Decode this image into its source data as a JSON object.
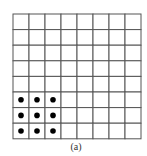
{
  "figure": {
    "caption": "(a)",
    "grid": {
      "rows": 8,
      "cols": 8,
      "line_color": "#555555",
      "dot_color": "#000000",
      "dots": [
        {
          "row": 5,
          "col": 0
        },
        {
          "row": 5,
          "col": 1
        },
        {
          "row": 5,
          "col": 2
        },
        {
          "row": 6,
          "col": 0
        },
        {
          "row": 6,
          "col": 1
        },
        {
          "row": 6,
          "col": 2
        },
        {
          "row": 7,
          "col": 0
        },
        {
          "row": 7,
          "col": 1
        },
        {
          "row": 7,
          "col": 2
        }
      ]
    }
  }
}
